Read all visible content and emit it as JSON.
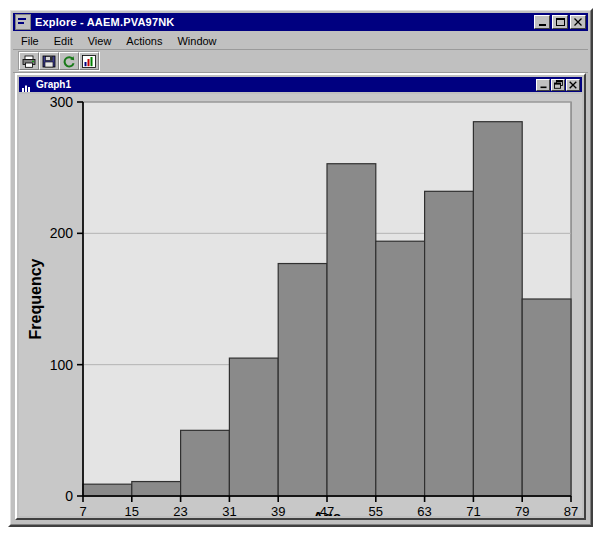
{
  "window": {
    "title": "Explore - AAEM.PVA97NK",
    "icon": "explore-icon",
    "controls": {
      "minimize": "_",
      "maximize": "□",
      "close": "✕"
    }
  },
  "menubar": {
    "items": [
      {
        "label": "File"
      },
      {
        "label": "Edit"
      },
      {
        "label": "View"
      },
      {
        "label": "Actions"
      },
      {
        "label": "Window"
      }
    ]
  },
  "toolbar": {
    "buttons": [
      {
        "name": "print-icon",
        "tip": "Print"
      },
      {
        "name": "save-icon",
        "tip": "Save"
      },
      {
        "name": "refresh-icon",
        "tip": "Refresh"
      },
      {
        "name": "chart-icon",
        "tip": "Graph"
      }
    ]
  },
  "mdi_window": {
    "title": "Graph1",
    "icon": "histogram-icon",
    "controls": {
      "minimize": "_",
      "restore": "❐",
      "close": "✕"
    }
  },
  "colors": {
    "titlebar": "#000080",
    "titlebar_text": "#ffffff",
    "face": "#c0c0c0",
    "plot_background": "#e4e4e4",
    "chart_background": "#c8c8c8",
    "bar_fill": "#8a8a8a",
    "bar_stroke": "#303030",
    "axis": "#000000",
    "gridline": "#b4b4b4"
  },
  "chart_data": {
    "type": "bar",
    "title": "",
    "subtitle": "",
    "xlabel": "Age",
    "ylabel": "Frequency",
    "bin_width": 8,
    "bin_edges": [
      7,
      15,
      23,
      31,
      39,
      47,
      55,
      63,
      71,
      79,
      87
    ],
    "categories": [
      "7-15",
      "15-23",
      "23-31",
      "31-39",
      "39-47",
      "47-55",
      "55-63",
      "63-71",
      "71-79",
      "79-87"
    ],
    "values": [
      9,
      11,
      50,
      105,
      177,
      253,
      194,
      232,
      285,
      150
    ],
    "xtick_labels": [
      "7",
      "15",
      "23",
      "31",
      "39",
      "47",
      "55",
      "63",
      "71",
      "79",
      "87"
    ],
    "ytick_labels": [
      "0",
      "100",
      "200",
      "300"
    ],
    "yticks": [
      0,
      100,
      200,
      300
    ],
    "xlim": [
      7,
      87
    ],
    "ylim": [
      0,
      300
    ],
    "grid": true,
    "legend": false,
    "legend_position": "none"
  }
}
